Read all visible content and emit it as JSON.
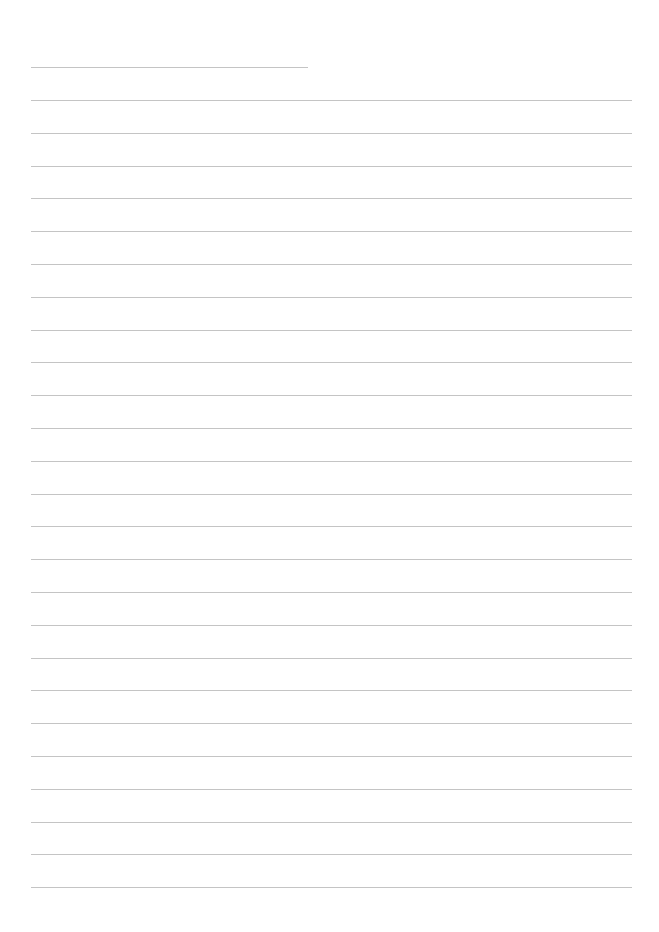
{
  "page": {
    "type": "lined-writing-sheet",
    "background_color": "#ffffff",
    "rule_color": "#c4c4c4",
    "title_line": {
      "top": 67,
      "left": 31,
      "width": 277
    },
    "writing_lines": {
      "count": 25,
      "first_top": 100,
      "spacing": 32.8,
      "left": 31,
      "width": 601
    },
    "text_content": []
  }
}
